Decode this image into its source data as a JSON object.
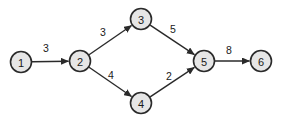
{
  "diagram": {
    "type": "directed-network",
    "nodes": [
      {
        "id": "1",
        "label": "1",
        "x": 21,
        "y": 62
      },
      {
        "id": "2",
        "label": "2",
        "x": 80,
        "y": 61
      },
      {
        "id": "3",
        "label": "3",
        "x": 141,
        "y": 19
      },
      {
        "id": "4",
        "label": "4",
        "x": 141,
        "y": 103
      },
      {
        "id": "5",
        "label": "5",
        "x": 204,
        "y": 61
      },
      {
        "id": "6",
        "label": "6",
        "x": 261,
        "y": 61
      }
    ],
    "edges": [
      {
        "from": "1",
        "to": "2",
        "weight": "3",
        "label_x": 46,
        "label_y": 48
      },
      {
        "from": "2",
        "to": "3",
        "weight": "3",
        "label_x": 103,
        "label_y": 32
      },
      {
        "from": "2",
        "to": "4",
        "weight": "4",
        "label_x": 111,
        "label_y": 75
      },
      {
        "from": "3",
        "to": "5",
        "weight": "5",
        "label_x": 173,
        "label_y": 29
      },
      {
        "from": "4",
        "to": "5",
        "weight": "2",
        "label_x": 169,
        "label_y": 76
      },
      {
        "from": "5",
        "to": "6",
        "weight": "8",
        "label_x": 229,
        "label_y": 50
      }
    ],
    "node_radius": 10.5,
    "colors": {
      "node_fill": "#e6e6e6",
      "stroke": "#2a2a2a",
      "text": "#1a1a1a",
      "background": "#ffffff"
    }
  }
}
